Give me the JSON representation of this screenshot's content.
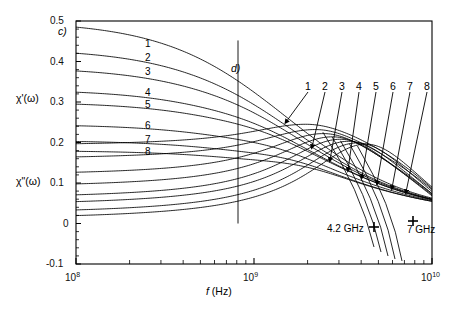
{
  "figure": {
    "panel_labels": [
      {
        "name": "panel-tag-c",
        "text": "c)",
        "x": 58,
        "y": 28
      },
      {
        "name": "panel-tag-d",
        "text": "d)",
        "x": 231,
        "y": 66
      }
    ],
    "axis_titles": {
      "y_upper": "χ'(ω)",
      "y_lower": "χ\"(ω)",
      "x_prefix": "f",
      "x_suffix": " (Hz)"
    },
    "markers": [
      {
        "name": "marker-4p2ghz",
        "label": "4.2 GHz",
        "label_x": 327,
        "label_y": 229,
        "x": 374,
        "y": 227
      },
      {
        "name": "marker-7ghz",
        "label": "7 GHz",
        "label_x": 413,
        "label_y": 228,
        "x": 413,
        "y": 221
      }
    ],
    "curve_numbers_left": [
      "1",
      "2",
      "3",
      "4",
      "5",
      "6",
      "7",
      "8"
    ],
    "curve_numbers_right": [
      "1",
      "2",
      "3",
      "4",
      "5",
      "6",
      "7",
      "8"
    ]
  },
  "chart_data": {
    "type": "line",
    "title": "",
    "xlabel": "f (Hz)",
    "ylabel": "χ'(ω), χ\"(ω)",
    "xscale": "log",
    "xlim": [
      100000000.0,
      10000000000.0
    ],
    "ylim": [
      -0.1,
      0.5
    ],
    "yticks": [
      -0.1,
      0,
      0.1,
      0.2,
      0.3,
      0.4,
      0.5
    ],
    "ytick_labels": [
      "-0.1",
      "0",
      "0.1",
      "0.2",
      "0.3",
      "0.4",
      "0.5"
    ],
    "xtick_labels": [
      "10⁸",
      "10⁹",
      "10¹⁰"
    ],
    "grid": false,
    "legend": "none",
    "annotations": [
      {
        "text": "c)",
        "kind": "panel-tag"
      },
      {
        "text": "d)",
        "kind": "panel-tag"
      },
      {
        "text": "4.2 GHz",
        "kind": "frequency-marker"
      },
      {
        "text": "7 GHz",
        "kind": "frequency-marker"
      }
    ],
    "series_groups": [
      {
        "group": "chi-prime",
        "description": "Real part of susceptibility, dispersion curves 1-8",
        "label_positions": [
          {
            "n": "1",
            "x": 145,
            "y": 44
          },
          {
            "n": "2",
            "x": 145,
            "y": 58
          },
          {
            "n": "3",
            "x": 145,
            "y": 72
          },
          {
            "n": "4",
            "x": 145,
            "y": 93
          },
          {
            "n": "5",
            "x": 145,
            "y": 105
          },
          {
            "n": "6",
            "x": 145,
            "y": 126
          },
          {
            "n": "7",
            "x": 145,
            "y": 140
          },
          {
            "n": "8",
            "x": 145,
            "y": 152
          }
        ],
        "series": [
          {
            "name": "1",
            "chi0": 0.5,
            "f0": 1550000000.0,
            "width": 1.0
          },
          {
            "name": "2",
            "chi0": 0.432,
            "f0": 1700000000.0,
            "width": 1.0
          },
          {
            "name": "3",
            "chi0": 0.386,
            "f0": 1850000000.0,
            "width": 1.0
          },
          {
            "name": "4",
            "chi0": 0.331,
            "f0": 2100000000.0,
            "width": 1.0
          },
          {
            "name": "5",
            "chi0": 0.3,
            "f0": 2350000000.0,
            "width": 1.0
          },
          {
            "name": "6",
            "chi0": 0.245,
            "f0": 2700000000.0,
            "width": 1.0
          },
          {
            "name": "7",
            "chi0": 0.205,
            "f0": 3100000000.0,
            "width": 1.0
          },
          {
            "name": "8",
            "chi0": 0.18,
            "f0": 3600000000.0,
            "width": 1.0
          }
        ]
      },
      {
        "group": "chi-double-prime",
        "description": "Imaginary part of susceptibility, absorption peaks 1-8",
        "label_positions": [
          {
            "n": "1",
            "x": 305,
            "y": 86
          },
          {
            "n": "2",
            "x": 322,
            "y": 86
          },
          {
            "n": "3",
            "x": 339,
            "y": 86
          },
          {
            "n": "4",
            "x": 356,
            "y": 86
          },
          {
            "n": "5",
            "x": 373,
            "y": 86
          },
          {
            "n": "6",
            "x": 390,
            "y": 86
          },
          {
            "n": "7",
            "x": 407,
            "y": 86
          },
          {
            "n": "8",
            "x": 424,
            "y": 86
          }
        ],
        "arrow_tips": [
          {
            "n": "1",
            "x": 286,
            "y": 122
          },
          {
            "n": "2",
            "x": 312,
            "y": 147
          },
          {
            "n": "3",
            "x": 330,
            "y": 160
          },
          {
            "n": "4",
            "x": 348,
            "y": 170
          },
          {
            "n": "5",
            "x": 362,
            "y": 177
          },
          {
            "n": "6",
            "x": 377,
            "y": 183
          },
          {
            "n": "7",
            "x": 392,
            "y": 188
          },
          {
            "n": "8",
            "x": 406,
            "y": 192
          }
        ],
        "series": [
          {
            "name": "1",
            "base": 0.192,
            "peak": 0.245,
            "f0": 1950000000.0,
            "width": 0.95
          },
          {
            "name": "2",
            "base": 0.158,
            "peak": 0.232,
            "f0": 2200000000.0,
            "width": 0.95
          },
          {
            "name": "3",
            "base": 0.118,
            "peak": 0.222,
            "f0": 2450000000.0,
            "width": 0.95
          },
          {
            "name": "4",
            "base": 0.088,
            "peak": 0.214,
            "f0": 2750000000.0,
            "width": 0.95
          },
          {
            "name": "5",
            "base": 0.06,
            "peak": 0.208,
            "f0": 3050000000.0,
            "width": 0.95
          },
          {
            "name": "6",
            "base": 0.043,
            "peak": 0.203,
            "f0": 3400000000.0,
            "width": 0.95
          },
          {
            "name": "7",
            "base": 0.022,
            "peak": 0.199,
            "f0": 3800000000.0,
            "width": 0.95
          },
          {
            "name": "8",
            "base": 0.008,
            "peak": 0.196,
            "f0": 4250000000.0,
            "width": 0.95
          }
        ]
      }
    ]
  },
  "axes": {
    "plot_left": 76,
    "plot_right": 432,
    "plot_top": 21,
    "plot_bottom": 264,
    "y_label_upper_pos": {
      "x": 16,
      "y": 98
    },
    "y_label_lower_pos": {
      "x": 16,
      "y": 181
    },
    "x_label_pos": {
      "x": 212,
      "y": 291
    },
    "vertical_cursor_x": 238
  }
}
